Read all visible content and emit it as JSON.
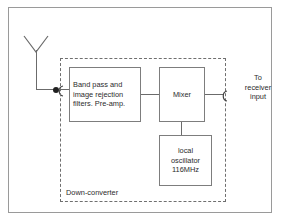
{
  "diagram": {
    "title_label": "Down-converter",
    "blocks": [
      {
        "id": "filter",
        "label": "Band pass and image rejection filters.  Pre-amp."
      },
      {
        "id": "mixer",
        "label": "Mixer"
      },
      {
        "id": "oscillator",
        "label": "local oscillator 116MHz"
      }
    ],
    "oscillator_lines": {
      "line1": "local",
      "line2": "oscillator",
      "line3": "116MHz"
    },
    "filter_lines": {
      "line1": "Band pass and",
      "line2": "image rejection",
      "line3": "filters.  Pre-amp."
    },
    "output_label": {
      "line1": "To",
      "line2": "receiver",
      "line3": "input"
    },
    "icons": {
      "antenna": "antenna-icon",
      "junction": "junction-dot-icon",
      "input_connector": "connector-icon",
      "output_connector": "connector-icon"
    },
    "colors": {
      "line": "#6b6b6b",
      "block_border": "#7d7d7d",
      "dashed_border": "#6f6f6f",
      "frame": "#9a9a9a",
      "text": "#2b2b2b",
      "background": "#ffffff",
      "junction": "#202020"
    }
  }
}
